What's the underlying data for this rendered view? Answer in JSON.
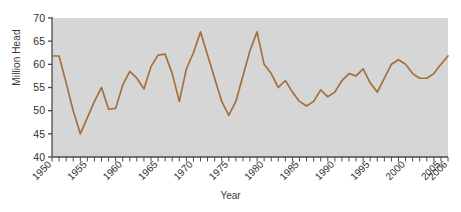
{
  "chart_data": {
    "type": "line",
    "title": "",
    "xlabel": "Year",
    "ylabel": "Million Head",
    "xlim": [
      1950,
      2006
    ],
    "ylim": [
      40,
      70
    ],
    "ytick_labels": [
      "40",
      "45",
      "50",
      "55",
      "60",
      "65",
      "70"
    ],
    "ytick_values": [
      40,
      45,
      50,
      55,
      60,
      65,
      70
    ],
    "xtick_labels": [
      "1950",
      "1955",
      "1960",
      "1965",
      "1970",
      "1975",
      "1980",
      "1985",
      "1990",
      "1995",
      "2000",
      "2005",
      "2006"
    ],
    "xtick_values": [
      1950,
      1955,
      1960,
      1965,
      1970,
      1975,
      1980,
      1985,
      1990,
      1995,
      2000,
      2005,
      2006
    ],
    "minor_xticks_every": 1,
    "grid": false,
    "legend": null,
    "legend_position": "none",
    "series": [
      {
        "name": "Cattle Inventory",
        "color": "#a3703f",
        "x": [
          1950,
          1951,
          1952,
          1953,
          1954,
          1955,
          1956,
          1957,
          1958,
          1959,
          1960,
          1961,
          1962,
          1963,
          1964,
          1965,
          1966,
          1967,
          1968,
          1969,
          1970,
          1971,
          1972,
          1973,
          1974,
          1975,
          1976,
          1977,
          1978,
          1979,
          1980,
          1981,
          1982,
          1983,
          1984,
          1985,
          1986,
          1987,
          1988,
          1989,
          1990,
          1991,
          1992,
          1993,
          1994,
          1995,
          1996,
          1997,
          1998,
          1999,
          2000,
          2001,
          2002,
          2003,
          2004,
          2005,
          2006
        ],
        "values": [
          61.8,
          61.8,
          56.0,
          50.0,
          45.0,
          48.5,
          52.0,
          55.0,
          50.3,
          50.5,
          55.5,
          58.5,
          57.0,
          54.7,
          59.5,
          62.0,
          62.2,
          58.0,
          52.0,
          59.0,
          62.5,
          67.0,
          62.0,
          57.0,
          52.0,
          49.0,
          52.0,
          57.5,
          63.0,
          67.0,
          60.0,
          58.0,
          55.0,
          56.5,
          54.0,
          52.0,
          51.0,
          52.0,
          54.5,
          53.0,
          54.0,
          56.5,
          58.0,
          57.5,
          59.0,
          56.0,
          54.0,
          57.0,
          60.0,
          61.0,
          60.0,
          58.0,
          57.0,
          57.0,
          58.0,
          60.0,
          61.8
        ]
      }
    ]
  },
  "axes": {
    "ylabel_text": "Million Head",
    "xlabel_text": "Year"
  }
}
